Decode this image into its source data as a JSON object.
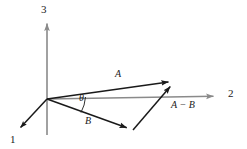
{
  "figure": {
    "type": "vector-diagram",
    "background_color": "#ffffff",
    "axis_color": "#8a8a8a",
    "vector_color": "#1a1a1a",
    "width": 247,
    "height": 149,
    "axes": [
      {
        "id": "axis-1",
        "label": "1",
        "label_x": 12,
        "label_y": 135,
        "from": [
          47,
          99
        ],
        "to": [
          16,
          132
        ],
        "color": "#1a1a1a",
        "arrow": true
      },
      {
        "id": "axis-2",
        "label": "2",
        "label_x": 228,
        "label_y": 89,
        "from": [
          47,
          99
        ],
        "to": [
          222,
          96
        ],
        "color": "#8a8a8a",
        "arrow": true
      },
      {
        "id": "axis-3",
        "label": "3",
        "label_x": 41,
        "label_y": 5,
        "from": [
          47,
          135
        ],
        "to": [
          47,
          22
        ],
        "color": "#8a8a8a",
        "arrow": true
      }
    ],
    "vectors": [
      {
        "id": "vector-a",
        "label": "A",
        "label_x": 116,
        "label_y": 72,
        "from": [
          47,
          99
        ],
        "to": [
          175,
          81
        ],
        "color": "#1a1a1a"
      },
      {
        "id": "vector-b",
        "label": "B",
        "label_x": 86,
        "label_y": 118,
        "from": [
          47,
          99
        ],
        "to": [
          133,
          130
        ],
        "color": "#1a1a1a"
      },
      {
        "id": "vector-a-minus-b",
        "label": "A − B",
        "label_x": 172,
        "label_y": 100,
        "from": [
          133,
          130
        ],
        "to": [
          175,
          81
        ],
        "color": "#1a1a1a"
      }
    ],
    "angle": {
      "id": "angle-theta",
      "label": "θ",
      "label_x": 79,
      "label_y": 93,
      "vertex": [
        47,
        99
      ],
      "radius": 38
    }
  }
}
